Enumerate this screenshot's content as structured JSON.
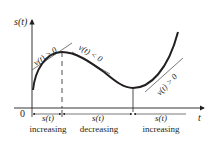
{
  "diagram": {
    "y_axis_label": "s(t)",
    "x_axis_label": "t",
    "origin_label": "0",
    "tangent_labels": [
      "v(t) > 0",
      "v(t) < 0",
      "v(t) > 0"
    ],
    "intervals": [
      {
        "function_label": "s(t)",
        "behavior": "increasing"
      },
      {
        "function_label": "s(t)",
        "behavior": "decreasing"
      },
      {
        "function_label": "s(t)",
        "behavior": "increasing"
      }
    ],
    "colors": {
      "curve": "#231f20",
      "axes": "#231f20",
      "tangents": "#555555",
      "background": "#ffffff"
    }
  }
}
